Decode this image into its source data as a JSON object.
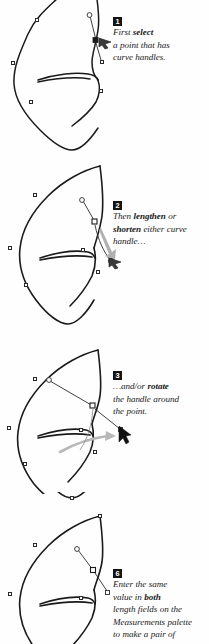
{
  "figure": {
    "background_color": "#ffffff",
    "ink_color": "#1a1a1a",
    "arrow_color": "#a8a8a8",
    "badge_background": "#141414",
    "badge_text_color": "#ffffff",
    "width": 209,
    "height": 644
  },
  "panels": [
    {
      "step": "1",
      "lines": [
        {
          "segments": [
            {
              "text": "First ",
              "bold": false
            },
            {
              "text": "select",
              "bold": true
            }
          ]
        },
        {
          "segments": [
            {
              "text": "a point that has",
              "bold": false
            }
          ]
        },
        {
          "segments": [
            {
              "text": "curve handles.",
              "bold": false
            }
          ]
        }
      ],
      "illustration_name": "bezier-shape-select-point"
    },
    {
      "step": "2",
      "lines": [
        {
          "segments": [
            {
              "text": "Then ",
              "bold": false
            },
            {
              "text": "lengthen",
              "bold": true
            },
            {
              "text": " or",
              "bold": false
            }
          ]
        },
        {
          "segments": [
            {
              "text": "shorten",
              "bold": true
            },
            {
              "text": " either curve",
              "bold": false
            }
          ]
        },
        {
          "segments": [
            {
              "text": "handle…",
              "bold": false
            }
          ]
        }
      ],
      "illustration_name": "bezier-shape-lengthen-handle"
    },
    {
      "step": "3",
      "lines": [
        {
          "segments": [
            {
              "text": "…and/or ",
              "bold": false
            },
            {
              "text": "rotate",
              "bold": true
            }
          ]
        },
        {
          "segments": [
            {
              "text": "the handle around",
              "bold": false
            }
          ]
        },
        {
          "segments": [
            {
              "text": "the point.",
              "bold": false
            }
          ]
        }
      ],
      "illustration_name": "bezier-shape-rotate-handle"
    },
    {
      "step": "6",
      "lines": [
        {
          "segments": [
            {
              "text": "Enter the same",
              "bold": false
            }
          ]
        },
        {
          "segments": [
            {
              "text": "value in ",
              "bold": false
            },
            {
              "text": "both",
              "bold": true
            }
          ]
        },
        {
          "segments": [
            {
              "text": "length fields on the",
              "bold": false
            }
          ]
        },
        {
          "segments": [
            {
              "text": "Measurements palette",
              "bold": false
            }
          ]
        },
        {
          "segments": [
            {
              "text": "to make a pair of",
              "bold": false
            }
          ]
        }
      ],
      "illustration_name": "bezier-shape-measurements-palette"
    }
  ],
  "margin_text": {
    "visible_fragment": "e\ne."
  }
}
